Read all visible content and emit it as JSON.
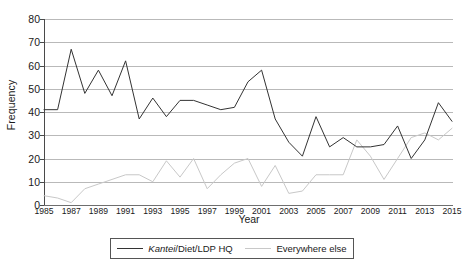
{
  "chart_data": {
    "type": "line",
    "title": "",
    "xlabel": "Year",
    "ylabel": "Frequency",
    "ylim": [
      0,
      80
    ],
    "ytick_step": 10,
    "yticks": [
      0,
      10,
      20,
      30,
      40,
      50,
      60,
      70,
      80
    ],
    "grid": true,
    "legend_position": "bottom",
    "x": [
      1985,
      1986,
      1987,
      1988,
      1989,
      1990,
      1991,
      1992,
      1993,
      1994,
      1995,
      1996,
      1997,
      1998,
      1999,
      2000,
      2001,
      2002,
      2003,
      2004,
      2005,
      2006,
      2007,
      2008,
      2009,
      2010,
      2011,
      2012,
      2013,
      2014,
      2015
    ],
    "xtick_labels": [
      "1985",
      "1987",
      "1989",
      "1991",
      "1993",
      "1995",
      "1997",
      "1999",
      "2001",
      "2003",
      "2005",
      "2007",
      "2009",
      "2011",
      "2013",
      "2015"
    ],
    "series": [
      {
        "name": "Kantei/Diet/LDP HQ",
        "name_italic_prefix": "Kantei",
        "name_rest": "/Diet/LDP HQ",
        "color": "#333333",
        "values": [
          41,
          41,
          67,
          48,
          58,
          47,
          62,
          37,
          46,
          38,
          45,
          45,
          43,
          41,
          42,
          53,
          58,
          37,
          27,
          21,
          38,
          25,
          29,
          25,
          25,
          26,
          34,
          20,
          28,
          44,
          36
        ]
      },
      {
        "name": "Everywhere else",
        "color": "#c8c8c8",
        "values": [
          4,
          3,
          1,
          7,
          9,
          11,
          13,
          13,
          10,
          19,
          12,
          20,
          7,
          13,
          18,
          20,
          8,
          17,
          5,
          6,
          13,
          13,
          13,
          28,
          21,
          11,
          20,
          29,
          31,
          28,
          33
        ]
      }
    ]
  },
  "legend": {
    "items": [
      {
        "label_italic": "Kantei",
        "label_rest": "/Diet/LDP HQ"
      },
      {
        "label": "Everywhere else"
      }
    ]
  },
  "axes": {
    "x_title": "Year",
    "y_title": "Frequency"
  }
}
